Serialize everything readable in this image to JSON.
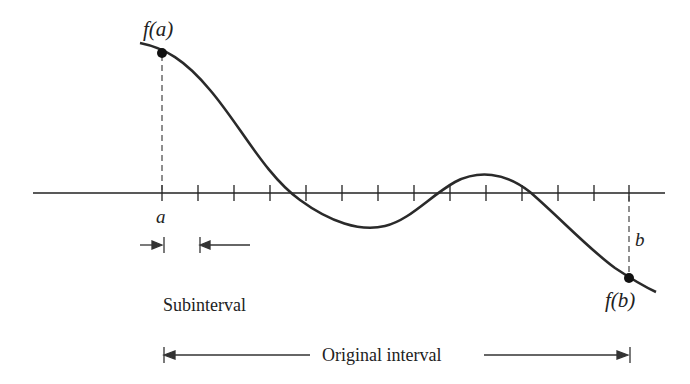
{
  "diagram": {
    "labels": {
      "fa": "f(a)",
      "fb": "f(b)",
      "a": "a",
      "b": "b",
      "subinterval": "Subinterval",
      "original_interval": "Original interval"
    },
    "axis": {
      "x_start": 33,
      "x_end": 665,
      "y": 193
    },
    "ticks_x": [
      162,
      198,
      234,
      270,
      306,
      342,
      378,
      414,
      450,
      486,
      522,
      558,
      594,
      629
    ],
    "points": {
      "a": {
        "x": 162,
        "y": 53
      },
      "b": {
        "x": 629,
        "y": 278
      }
    },
    "colors": {
      "line": "#222222",
      "dashed": "#444444"
    }
  }
}
